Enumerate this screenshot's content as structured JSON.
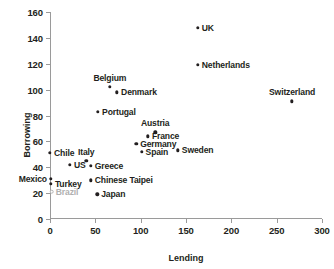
{
  "chart_data": {
    "type": "scatter",
    "title": "",
    "xlabel": "Lending",
    "ylabel": "Borrowing",
    "xlim": [
      0,
      300
    ],
    "ylim": [
      0,
      160
    ],
    "xticks": [
      0,
      50,
      100,
      150,
      200,
      250,
      300
    ],
    "yticks": [
      0,
      20,
      40,
      60,
      80,
      100,
      120,
      140,
      160
    ],
    "grid": false,
    "legend": "none",
    "marker_color": "#231f20",
    "muted_color": "#b0b0b0",
    "points": [
      {
        "label": "UK",
        "x": 163,
        "y": 148,
        "anchor": "right"
      },
      {
        "label": "Netherlands",
        "x": 163,
        "y": 119,
        "anchor": "right"
      },
      {
        "label": "Switzerland",
        "x": 267,
        "y": 91,
        "anchor": "top"
      },
      {
        "label": "Belgium",
        "x": 66,
        "y": 102,
        "anchor": "top"
      },
      {
        "label": "Denmark",
        "x": 74,
        "y": 98,
        "anchor": "right"
      },
      {
        "label": "Portugal",
        "x": 53,
        "y": 83,
        "anchor": "right"
      },
      {
        "label": "Austria",
        "x": 116,
        "y": 67,
        "anchor": "top"
      },
      {
        "label": "France",
        "x": 108,
        "y": 64,
        "anchor": "right"
      },
      {
        "label": "Germany",
        "x": 95,
        "y": 58,
        "anchor": "right"
      },
      {
        "label": "Spain",
        "x": 101,
        "y": 52,
        "anchor": "right"
      },
      {
        "label": "Sweden",
        "x": 141,
        "y": 53,
        "anchor": "right"
      },
      {
        "label": "Chile",
        "x": 0,
        "y": 51,
        "anchor": "right"
      },
      {
        "label": "Italy",
        "x": 40,
        "y": 45,
        "anchor": "top"
      },
      {
        "label": "Greece",
        "x": 45,
        "y": 41,
        "anchor": "right"
      },
      {
        "label": "US",
        "x": 22,
        "y": 42,
        "anchor": "right"
      },
      {
        "label": "Chinese Taipei",
        "x": 45,
        "y": 30,
        "anchor": "right"
      },
      {
        "label": "Mexico",
        "x": 1,
        "y": 31,
        "anchor": "left"
      },
      {
        "label": "Turkey",
        "x": 1,
        "y": 27,
        "anchor": "right"
      },
      {
        "label": "Brazil",
        "x": 2,
        "y": 21,
        "anchor": "right",
        "muted": true,
        "hollow": true
      },
      {
        "label": "Japan",
        "x": 52,
        "y": 19,
        "anchor": "right"
      }
    ]
  }
}
